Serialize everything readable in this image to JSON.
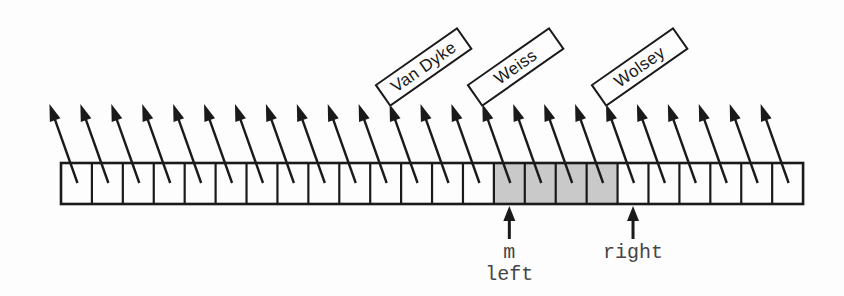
{
  "figure": {
    "background_color": "#fdfdfd",
    "ink_color": "#1a1a1a",
    "array": {
      "cell_count": 24,
      "shaded_cells": [
        14,
        15,
        16,
        17
      ],
      "shade_color": "#c9c9c9",
      "cell_fill": "#fdfdfd"
    },
    "name_labels": {
      "rotation_deg": -35,
      "items": [
        {
          "text": "Van Dyke",
          "cell_index": 11
        },
        {
          "text": "Weiss",
          "cell_index": 14
        },
        {
          "text": "Wolsey",
          "cell_index": 18
        }
      ]
    },
    "index_pointers": {
      "text_color": "#454545",
      "items": [
        {
          "lines": [
            "m",
            "left"
          ],
          "cell_index": 14
        },
        {
          "lines": [
            "right"
          ],
          "cell_index": 18
        }
      ]
    }
  }
}
